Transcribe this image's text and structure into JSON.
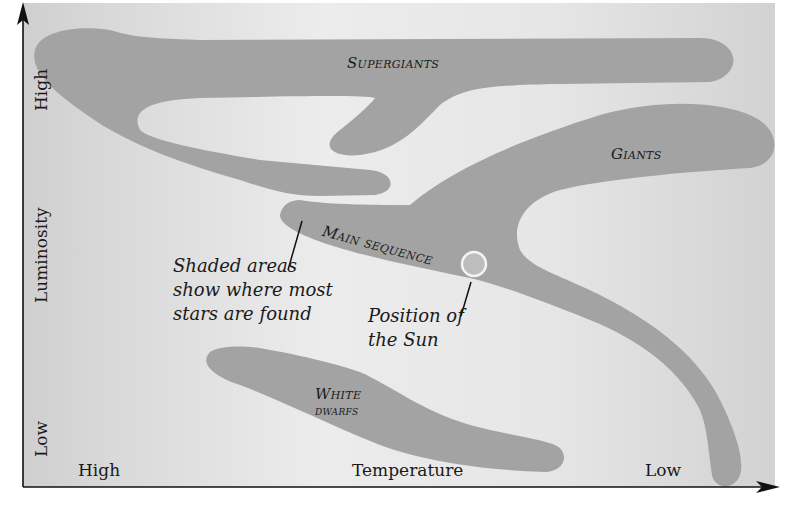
{
  "diagram": {
    "y_axis": {
      "label": "Luminosity",
      "high": "High",
      "low": "Low"
    },
    "x_axis": {
      "label": "Temperature",
      "high": "High",
      "low": "Low"
    },
    "regions": {
      "supergiants": "Supergiants",
      "giants": "Giants",
      "main_sequence": "Main sequence",
      "white_dwarfs_1": "White",
      "white_dwarfs_2": "dwarfs"
    },
    "annotations": {
      "shaded_1": "Shaded areas",
      "shaded_2": "show where most",
      "shaded_3": "stars are found",
      "sun_1": "Position of",
      "sun_2": "the Sun"
    },
    "colors": {
      "background": "#dcdcdc",
      "background_light": "#ececec",
      "region_fill": "#a3a3a3",
      "sun_fill": "#bdbdbd",
      "sun_stroke": "#f4f4f4",
      "axis": "#111111"
    }
  }
}
